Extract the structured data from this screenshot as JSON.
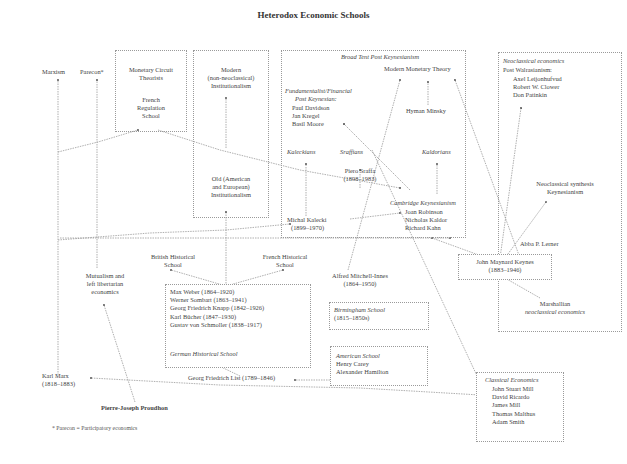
{
  "title": "Heterodox Economic Schools",
  "nodes": {
    "marxism": "Marxism",
    "parecon": "Parecon*",
    "monetary_circuit": [
      "Monetary Circuit",
      "Theorists"
    ],
    "french_regulation": [
      "French",
      "Regulation",
      "School"
    ],
    "modern_institutionalism": [
      "Modern",
      "(non-neoclassical)",
      "Institutionalism"
    ],
    "old_institutionalism": [
      "Old (American",
      "and European)",
      "Institutionalism"
    ],
    "broad_tent_header": "Broad Tent Post Keynesianism",
    "modern_monetary_theory": "Modern Monetary Theory",
    "fundamentalist_header": [
      "Fundamentalist/Financial",
      "Post Keynesian:"
    ],
    "fundamentalist_members": [
      "Paul Davidson",
      "Jan Kregel",
      "Basil Moore"
    ],
    "hyman_minsky": "Hyman Minsky",
    "kaleckians": "Kaleckians",
    "sraffians": "Sraffians",
    "kaldorians": "Kaldorians",
    "piero_sraffa": [
      "Piero Sraffa",
      "(1898–1983)"
    ],
    "cambridge_header": "Cambridge Keynesianism",
    "cambridge_members": [
      "Joan Robinson",
      "Nicholas Kaldor",
      "Richard Kahn"
    ],
    "michal_kalecki": [
      "Michal Kalecki",
      "(1899–1970)"
    ],
    "neoclassical_header": "Neoclassical economics",
    "post_walrasianism": "Post Walrasianism:",
    "post_walrasian_members": [
      "Axel Leijonhufvud",
      "Robert W. Clower",
      "Don Patinkin"
    ],
    "neoclassical_synthesis": [
      "Neoclassical synthesis",
      "Keynesianism"
    ],
    "abba_lerner": "Abba P. Lerner",
    "keynes": [
      "John Maynard Keynes",
      "(1883–1946)"
    ],
    "marshallian": [
      "Marshallian",
      "neoclassical economics"
    ],
    "british_historical": [
      "British Historical",
      "School"
    ],
    "french_historical": [
      "French Historical",
      "School"
    ],
    "mutualism": [
      "Mutualism and",
      "left libertarian",
      "economics"
    ],
    "german_members": [
      "Max Weber (1864–1920)",
      "Werner Sombart (1863–1941)",
      "Georg Friedrich Knapp (1842–1926)",
      "Karl Bücher (1847–1930)",
      "Gustav von Schmoller (1838–1917)"
    ],
    "german_header": "German Historical School",
    "alfred_mitchell_innes": [
      "Alfred Mitchell-Innes",
      "(1864–1950)"
    ],
    "birmingham_header": "Birmingham School",
    "birmingham_years": "(1815–1850s)",
    "american_header": "American School",
    "american_members": [
      "Henry Carey",
      "Alexander Hamilton"
    ],
    "georg_list": "Georg Friedrich List (1789–1846)",
    "karl_marx": [
      "Karl Marx",
      "(1818–1883)"
    ],
    "proudhon": "Pierre-Joseph Proudhon",
    "classical_header": "Classical Economics",
    "classical_members": [
      "John Stuart Mill",
      "David Ricardo",
      "James Mill",
      "Thomas Malthus",
      "Adam Smith"
    ]
  },
  "footnote": "* Parecon = Participatory economics",
  "colors": {
    "line": "#8c8c8c",
    "border": "#9a9a9a",
    "text": "#444444",
    "background": "#ffffff"
  }
}
